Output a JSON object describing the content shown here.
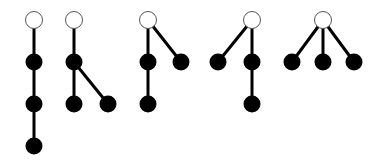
{
  "diagram": {
    "title": "",
    "colors": {
      "edge": "#000000",
      "root_fill": "#ffffff",
      "root_stroke": "#555555",
      "node_fill": "#000000"
    },
    "trees": [
      {
        "id": "tree-1",
        "nodes": [
          {
            "id": "r",
            "x": 34,
            "y": 20,
            "root": true
          },
          {
            "id": "a",
            "x": 34,
            "y": 62
          },
          {
            "id": "b",
            "x": 34,
            "y": 104
          },
          {
            "id": "c",
            "x": 34,
            "y": 146
          }
        ],
        "edges": [
          [
            "r",
            "a"
          ],
          [
            "a",
            "b"
          ],
          [
            "b",
            "c"
          ]
        ]
      },
      {
        "id": "tree-2",
        "nodes": [
          {
            "id": "r",
            "x": 74,
            "y": 20,
            "root": true
          },
          {
            "id": "a",
            "x": 74,
            "y": 62
          },
          {
            "id": "b",
            "x": 74,
            "y": 104
          },
          {
            "id": "c",
            "x": 108,
            "y": 104
          }
        ],
        "edges": [
          [
            "r",
            "a"
          ],
          [
            "a",
            "b"
          ],
          [
            "a",
            "c"
          ]
        ]
      },
      {
        "id": "tree-3",
        "nodes": [
          {
            "id": "r",
            "x": 148,
            "y": 20,
            "root": true
          },
          {
            "id": "a",
            "x": 148,
            "y": 62
          },
          {
            "id": "b",
            "x": 181,
            "y": 62
          },
          {
            "id": "c",
            "x": 148,
            "y": 104
          }
        ],
        "edges": [
          [
            "r",
            "a"
          ],
          [
            "r",
            "b"
          ],
          [
            "a",
            "c"
          ]
        ]
      },
      {
        "id": "tree-4",
        "nodes": [
          {
            "id": "r",
            "x": 252,
            "y": 20,
            "root": true
          },
          {
            "id": "a",
            "x": 218,
            "y": 62
          },
          {
            "id": "b",
            "x": 252,
            "y": 62
          },
          {
            "id": "c",
            "x": 252,
            "y": 104
          }
        ],
        "edges": [
          [
            "r",
            "a"
          ],
          [
            "r",
            "b"
          ],
          [
            "b",
            "c"
          ]
        ]
      },
      {
        "id": "tree-5",
        "nodes": [
          {
            "id": "r",
            "x": 323,
            "y": 20,
            "root": true
          },
          {
            "id": "a",
            "x": 292,
            "y": 62
          },
          {
            "id": "b",
            "x": 323,
            "y": 62
          },
          {
            "id": "c",
            "x": 354,
            "y": 62
          }
        ],
        "edges": [
          [
            "r",
            "a"
          ],
          [
            "r",
            "b"
          ],
          [
            "r",
            "c"
          ]
        ]
      }
    ]
  }
}
